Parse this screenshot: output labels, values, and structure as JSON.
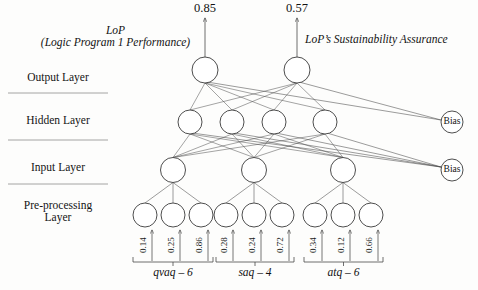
{
  "diagram": {
    "title_left_line1": "LoP",
    "title_left_line2": "(Logic  Program 1 Performance)",
    "title_right": "LoP’s Sustainability Assurance",
    "layer_labels": [
      "Output  Layer",
      "Hidden Layer",
      "Input Layer",
      "Pre-processing",
      "Layer"
    ],
    "outputs": [
      {
        "value": "0.85",
        "x": 205
      },
      {
        "value": "0.57",
        "x": 297
      }
    ],
    "bias_label": "Bias",
    "bias_nodes": [
      {
        "label": "Bias",
        "x": 452,
        "y": 122
      },
      {
        "label": "Bias",
        "x": 452,
        "y": 170
      }
    ],
    "output_nodes": [
      {
        "x": 205,
        "y": 70
      },
      {
        "x": 297,
        "y": 70
      }
    ],
    "hidden_nodes": [
      {
        "x": 190,
        "y": 122
      },
      {
        "x": 232,
        "y": 122
      },
      {
        "x": 274,
        "y": 122
      },
      {
        "x": 325,
        "y": 122
      }
    ],
    "input_nodes": [
      {
        "x": 173,
        "y": 170
      },
      {
        "x": 254,
        "y": 170
      },
      {
        "x": 343,
        "y": 170
      }
    ],
    "preprocessing_nodes": [
      {
        "x": 145,
        "y": 215
      },
      {
        "x": 173,
        "y": 215
      },
      {
        "x": 201,
        "y": 215
      },
      {
        "x": 226,
        "y": 215
      },
      {
        "x": 254,
        "y": 215
      },
      {
        "x": 282,
        "y": 215
      },
      {
        "x": 315,
        "y": 215
      },
      {
        "x": 343,
        "y": 215
      },
      {
        "x": 371,
        "y": 215
      }
    ],
    "input_groups": [
      {
        "label": "qvaq – 6",
        "bracket_left": 133,
        "bracket_right": 213,
        "values": [
          {
            "value": "0.14",
            "x": 145
          },
          {
            "value": "0.25",
            "x": 173
          },
          {
            "value": "0.86",
            "x": 201
          }
        ]
      },
      {
        "label": "saq – 4",
        "bracket_left": 216,
        "bracket_right": 294,
        "values": [
          {
            "value": "0.28",
            "x": 226
          },
          {
            "value": "0.24",
            "x": 254
          },
          {
            "value": "0.72",
            "x": 282
          }
        ]
      },
      {
        "label": "atq – 6",
        "bracket_left": 304,
        "bracket_right": 383,
        "values": [
          {
            "value": "0.34",
            "x": 315
          },
          {
            "value": "0.12",
            "x": 343
          },
          {
            "value": "0.66",
            "x": 371
          }
        ]
      }
    ],
    "colors": {
      "stroke": "#4a4a4a",
      "node_stroke": "#3a3a3a",
      "text": "#141414",
      "background": "#fdfdfc"
    }
  }
}
